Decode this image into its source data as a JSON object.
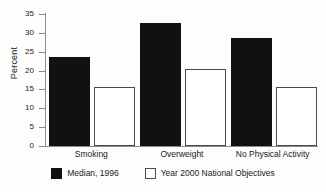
{
  "chart_data": {
    "type": "bar",
    "title": "",
    "xlabel": "",
    "ylabel": "Percent",
    "ylim": [
      0,
      35
    ],
    "yticks": [
      0,
      5,
      10,
      15,
      20,
      25,
      30,
      35
    ],
    "grid": false,
    "legend_position": "bottom",
    "categories": [
      "Smoking",
      "Overweight",
      "No Physical Activity"
    ],
    "series": [
      {
        "name": "Median, 1996",
        "style": "filled",
        "color": "#111111",
        "values": [
          23,
          32,
          28
        ]
      },
      {
        "name": "Year 2000 National Objectives",
        "style": "open",
        "color": "#ffffff",
        "values": [
          15,
          20,
          15
        ]
      }
    ]
  },
  "axis": {
    "y_title": "Percent",
    "ticks": [
      {
        "label": "35",
        "value": 35
      },
      {
        "label": "30",
        "value": 30
      },
      {
        "label": "25",
        "value": 25
      },
      {
        "label": "20",
        "value": 20
      },
      {
        "label": "15",
        "value": 15
      },
      {
        "label": "10",
        "value": 10
      },
      {
        "label": "5",
        "value": 5
      },
      {
        "label": "0",
        "value": 0
      }
    ]
  },
  "categories": [
    {
      "label": "Smoking"
    },
    {
      "label": "Overweight"
    },
    {
      "label": "No Physical Activity"
    }
  ],
  "legend": {
    "items": [
      {
        "label": "Median, 1996",
        "swatch": "filled-square-icon"
      },
      {
        "label": "Year 2000 National Objectives",
        "swatch": "open-square-icon"
      }
    ]
  }
}
